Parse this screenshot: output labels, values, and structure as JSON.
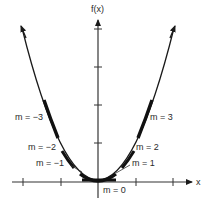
{
  "diagram": {
    "axes": {
      "y_label": "f(x)",
      "x_label": "x"
    },
    "labels": {
      "m_neg3": "m = −3",
      "m_neg2": "m = −2",
      "m_neg1": "m = −1",
      "m_0": "m = 0",
      "m_1": "m = 1",
      "m_2": "m = 2",
      "m_3": "m = 3"
    },
    "colors": {
      "ink": "#1a1a1a",
      "axis": "#333333",
      "background": "#ffffff"
    }
  }
}
